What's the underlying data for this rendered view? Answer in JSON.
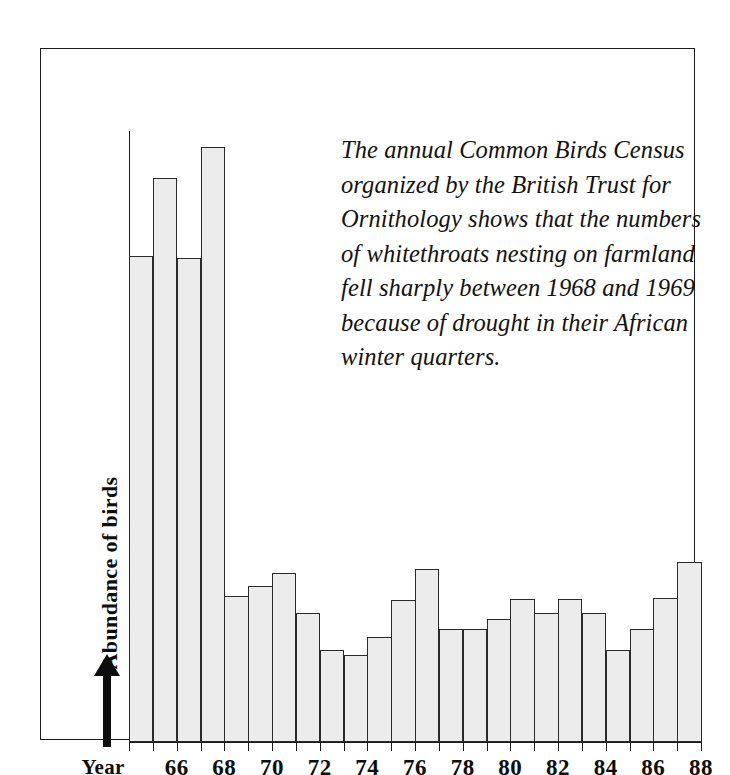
{
  "figure": {
    "background": "#ffffff",
    "frame_color": "#1b1b1b",
    "bar_fill": "#ececec",
    "bar_stroke": "#2a2a2a"
  },
  "annotation": {
    "lines": [
      "The annual Common Birds Census",
      "organized by the British Trust for",
      "Ornithology shows that the numbers",
      "of whitethroats nesting on farmland",
      "fell sharply between 1968 and 1969",
      "because of drought in their African",
      "winter quarters."
    ],
    "full_text": "The annual Common Birds Census organized by the British Trust for Ornithology shows that the numbers of whitethroats nesting on farmland fell sharply between 1968 and 1969 because of drought in their African winter quarters."
  },
  "axes": {
    "y_caption": "Abundance of birds",
    "y_arrow": "up-arrow",
    "x_year_word": "Year",
    "x_tick_labels": [
      "66",
      "68",
      "70",
      "72",
      "74",
      "76",
      "78",
      "80",
      "82",
      "84",
      "86",
      "88"
    ]
  },
  "chart_data": {
    "type": "bar",
    "title": "",
    "subtitle": "",
    "xlabel": "Year",
    "ylabel": "Abundance of birds",
    "grid": false,
    "legend": "none",
    "ylim": [
      0,
      620
    ],
    "y_axis_ticks_shown": false,
    "x_tick_every": 2,
    "categories": [
      "65",
      "66",
      "67",
      "68",
      "69",
      "70",
      "71",
      "72",
      "73",
      "74",
      "75",
      "76",
      "77",
      "78",
      "79",
      "80",
      "81",
      "82",
      "83",
      "84",
      "85",
      "86",
      "87",
      "88"
    ],
    "full_years": [
      1965,
      1966,
      1967,
      1968,
      1969,
      1970,
      1971,
      1972,
      1973,
      1974,
      1975,
      1976,
      1977,
      1978,
      1979,
      1980,
      1981,
      1982,
      1983,
      1984,
      1985,
      1986,
      1987,
      1988
    ],
    "values": [
      493,
      572,
      491,
      604,
      148,
      158,
      172,
      131,
      93,
      88,
      107,
      144,
      176,
      115,
      115,
      125,
      145,
      131,
      145,
      131,
      93,
      115,
      146,
      183
    ],
    "annotations": [
      "Sharp fall between 1968 and 1969"
    ]
  }
}
